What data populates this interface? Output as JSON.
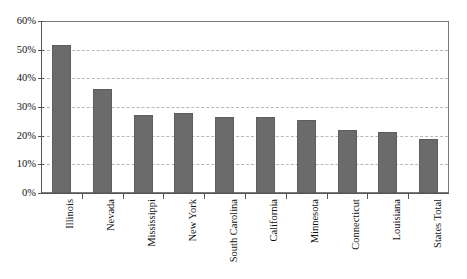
{
  "chart_data": {
    "type": "bar",
    "title": "",
    "xlabel": "",
    "ylabel": "",
    "categories": [
      "Illinois",
      "Nevada",
      "Mississippi",
      "New York",
      "South Carolina",
      "California",
      "Minnesota",
      "Connecticut",
      "Louisiana",
      "States Total"
    ],
    "values": [
      52.0,
      36.5,
      27.5,
      28.0,
      26.5,
      26.5,
      25.5,
      22.0,
      21.5,
      19.0
    ],
    "value_labels": [
      "52%",
      "36.5%",
      "27.5%",
      "28%",
      "26.5%",
      "26.5%",
      "25.5%",
      "22%",
      "21.5%",
      "19%"
    ],
    "ylim": [
      0,
      60
    ],
    "ytick_values": [
      0,
      10,
      20,
      30,
      40,
      50,
      60
    ],
    "ytick_labels": [
      "0%",
      "10%",
      "20%",
      "30%",
      "40%",
      "50%",
      "60%"
    ],
    "grid": true,
    "legend": false,
    "legend_position": "none",
    "bar_color": "#6b6b6b",
    "gridline_color": "#b9b9b9",
    "axis_color": "#555555",
    "frame_color": "#7a7a7a",
    "background_color": "#ffffff"
  }
}
